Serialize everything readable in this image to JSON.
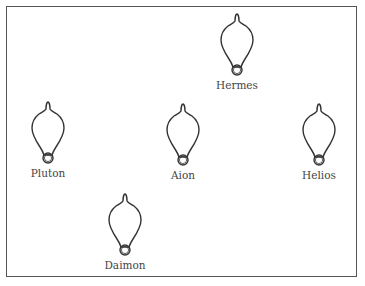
{
  "diagram": {
    "nodes": [
      {
        "id": "hermes",
        "label": "Hermes",
        "x": 207,
        "y": 13
      },
      {
        "id": "pluton",
        "label": "Pluton",
        "x": 18,
        "y": 101
      },
      {
        "id": "aion",
        "label": "Aion",
        "x": 153,
        "y": 103
      },
      {
        "id": "helios",
        "label": "Helios",
        "x": 289,
        "y": 103
      },
      {
        "id": "daimon",
        "label": "Daimon",
        "x": 95,
        "y": 193
      }
    ],
    "node_icon": "light-bulb-icon",
    "stroke_color": "#333333",
    "border_color": "#555555"
  }
}
